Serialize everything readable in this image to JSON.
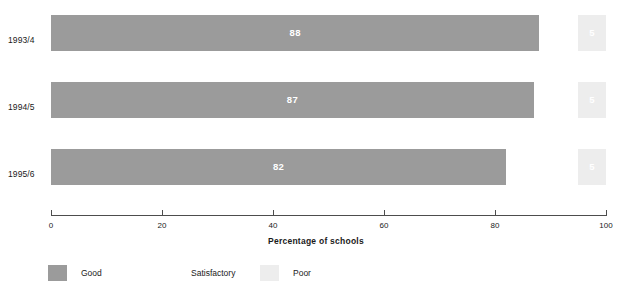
{
  "chart_data": {
    "type": "bar",
    "orientation": "horizontal",
    "stacked": true,
    "title": "",
    "xlabel": "Percentage of schools",
    "ylabel": "",
    "xlim": [
      0,
      100
    ],
    "xticks": [
      "0",
      "20",
      "40",
      "60",
      "80",
      "100"
    ],
    "grid": false,
    "legend_position": "bottom-left",
    "categories": [
      "1993/4",
      "1994/5",
      "1995/6"
    ],
    "series": [
      {
        "name": "Good",
        "color": "#9b9b9b",
        "values": [
          88,
          87,
          82
        ],
        "labels": [
          "88",
          "87",
          "82"
        ]
      },
      {
        "name": "Satisfactory",
        "color": "#ffffff",
        "values": [
          7,
          8,
          13
        ],
        "labels": [
          "",
          "",
          ""
        ]
      },
      {
        "name": "Poor",
        "color": "#ededed",
        "values": [
          5,
          5,
          5
        ],
        "labels": [
          "5",
          "5",
          "5"
        ]
      }
    ]
  },
  "axis": {
    "title": "Percentage of schools",
    "ticks": [
      {
        "label": "0",
        "value": 0
      },
      {
        "label": "20",
        "value": 20
      },
      {
        "label": "40",
        "value": 40
      },
      {
        "label": "60",
        "value": 60
      },
      {
        "label": "80",
        "value": 80
      },
      {
        "label": "100",
        "value": 100
      }
    ]
  },
  "categories": [
    {
      "label": "1993/4"
    },
    {
      "label": "1994/5"
    },
    {
      "label": "1995/6"
    }
  ],
  "legend": {
    "items": [
      {
        "label": "Good",
        "color": "#9b9b9b"
      },
      {
        "label": "Satisfactory",
        "color": "#ffffff"
      },
      {
        "label": "Poor",
        "color": "#ededed"
      }
    ]
  },
  "colors": {
    "good": "#9b9b9b",
    "satisfactory": "#ffffff",
    "poor": "#ededed",
    "axis": "#4d4d4d",
    "text": "#1a1a1a",
    "value_text": "#ffffff",
    "background": "#ffffff"
  }
}
